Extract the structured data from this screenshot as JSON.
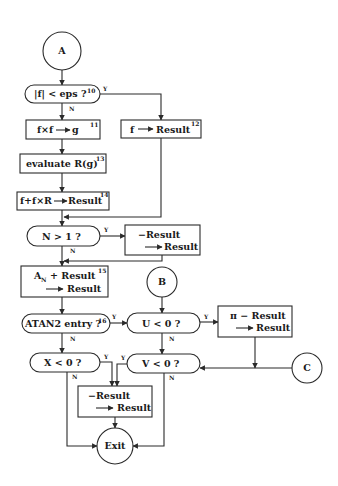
{
  "diagram": {
    "type": "flowchart",
    "connectors": {
      "a": "A",
      "b": "B",
      "c": "C",
      "exit": "Exit"
    },
    "decisions": {
      "abs_f_lt_eps": {
        "text": "|f|  <  eps  ?",
        "step": "10",
        "yes": "Y",
        "no": "N"
      },
      "n_gt_1": {
        "text": "N  >  1 ?",
        "yes": "Y",
        "no": "N"
      },
      "atan2_entry": {
        "text": "ATAN2  entry  ?",
        "step": "16",
        "yes": "Y",
        "no": "N"
      },
      "u_lt_0": {
        "text": "U  <  0  ?",
        "yes": "Y",
        "no": "N"
      },
      "x_lt_0": {
        "text": "X  <  0  ?",
        "yes": "Y",
        "no": "N"
      },
      "v_lt_0": {
        "text": "V  <  0  ?",
        "yes": "Y",
        "no": "N"
      }
    },
    "processes": {
      "fxf_to_g": {
        "text": "f×f",
        "arrow_target": "g",
        "step": "11"
      },
      "f_to_result": {
        "text": "f",
        "arrow_target": "Result",
        "step": "12"
      },
      "evaluate_r": {
        "text": "evaluate  R(g)",
        "step": "13"
      },
      "f_plus_fxr": {
        "text": "f+f×R",
        "arrow_target": "Result",
        "step": "14"
      },
      "negate_result_1": {
        "line1": "−Result",
        "line2": "Result"
      },
      "an_plus_result": {
        "line1_a": "A",
        "line1_sub": "N",
        "line1_b": "+  Result",
        "line2": "Result",
        "step": "15"
      },
      "pi_minus_result": {
        "line1": "π  −  Result",
        "line2": "Result"
      },
      "negate_result_2": {
        "line1": "−Result",
        "line2": "Result"
      }
    }
  }
}
